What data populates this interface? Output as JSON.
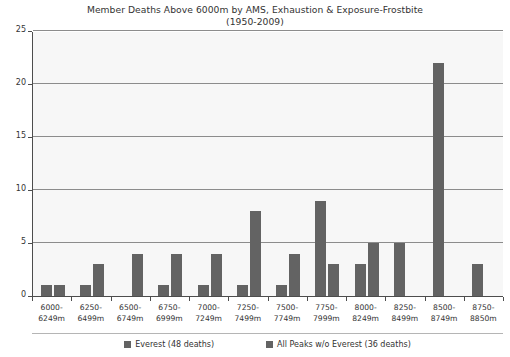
{
  "chart_data": {
    "type": "bar",
    "title": "Member Deaths Above 6000m by AMS, Exhaustion & Exposure-Frostbite",
    "subtitle": "(1950-2009)",
    "xlabel": "",
    "ylabel": "",
    "ylim": [
      0,
      25
    ],
    "yticks": [
      0,
      5,
      10,
      15,
      20,
      25
    ],
    "ytick_labels": [
      "0",
      "5",
      "10",
      "15",
      "20",
      "25"
    ],
    "grid": true,
    "legend_position": "bottom",
    "categories": [
      "6000-\n6249m",
      "6250-\n6499m",
      "6500-\n6749m",
      "6750-\n6999m",
      "7000-\n7249m",
      "7250-\n7499m",
      "7500-\n7749m",
      "7750-\n7999m",
      "8000-\n8249m",
      "8250-\n8499m",
      "8500-\n8749m",
      "8750-\n8850m"
    ],
    "category_lines": [
      [
        "6000-",
        "6249m"
      ],
      [
        "6250-",
        "6499m"
      ],
      [
        "6500-",
        "6749m"
      ],
      [
        "6750-",
        "6999m"
      ],
      [
        "7000-",
        "7249m"
      ],
      [
        "7250-",
        "7499m"
      ],
      [
        "7500-",
        "7749m"
      ],
      [
        "7750-",
        "7999m"
      ],
      [
        "8000-",
        "8249m"
      ],
      [
        "8250-",
        "8499m"
      ],
      [
        "8500-",
        "8749m"
      ],
      [
        "8750-",
        "8850m"
      ]
    ],
    "series": [
      {
        "name": "Everest (48 deaths)",
        "color": "#636363",
        "values": [
          1,
          1,
          0,
          1,
          1,
          1,
          1,
          9,
          3,
          5,
          22,
          3
        ]
      },
      {
        "name": "All Peaks w/o Everest (36 deaths)",
        "color": "#636363",
        "values": [
          1,
          3,
          4,
          4,
          4,
          8,
          4,
          3,
          5,
          0,
          0,
          0
        ]
      }
    ]
  },
  "legend": {
    "items": [
      {
        "label": "Everest (48 deaths)"
      },
      {
        "label": "All Peaks w/o Everest (36 deaths)"
      }
    ]
  },
  "colors": {
    "bar": "#636363",
    "plot_background": "#f7f7f7",
    "gridline": "#8c8c8c",
    "axis": "#4d4d4d",
    "text": "#333333"
  }
}
